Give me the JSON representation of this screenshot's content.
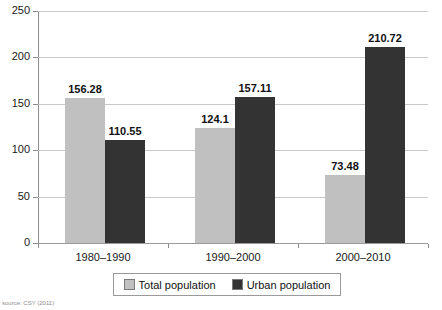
{
  "chart_data": {
    "type": "bar",
    "title": "",
    "subtitle": "",
    "xlabel": "",
    "ylabel": "",
    "categories": [
      "1980–1990",
      "1990–2000",
      "2000–2010"
    ],
    "series": [
      {
        "name": "Total population",
        "color": "#c0c0c0",
        "values": [
          156.28,
          124.1,
          73.48
        ],
        "labels": [
          "156.28",
          "124.1",
          "73.48"
        ]
      },
      {
        "name": "Urban population",
        "color": "#333333",
        "values": [
          110.55,
          157.11,
          210.72
        ],
        "labels": [
          "110.55",
          "157.11",
          "210.72"
        ]
      }
    ],
    "ylim": [
      0,
      250
    ],
    "y_ticks": [
      0,
      50,
      100,
      150,
      200,
      250
    ],
    "y_tick_labels": [
      "0",
      "50",
      "100",
      "150",
      "200",
      "250"
    ],
    "grid": "horizontal",
    "legend_position": "bottom"
  },
  "legend": {
    "entries": [
      {
        "label": "Total population",
        "swatch": "legend-swatch-total"
      },
      {
        "label": "Urban population",
        "swatch": "legend-swatch-urban"
      }
    ]
  },
  "source": {
    "text": "source: CSY (2011)"
  }
}
